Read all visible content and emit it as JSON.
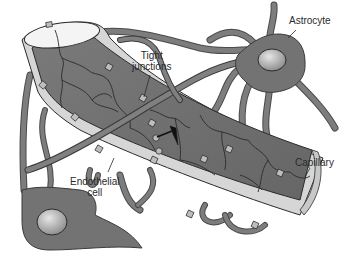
{
  "diagram": {
    "colors": {
      "process": "#7a7a7a",
      "process_stroke": "#3a3a3a",
      "astrocyte_body": "#727272",
      "nucleus": "#b5b5b5",
      "capillary_lumen": "#6f6f6f",
      "capillary_wall": "#d4d4d4",
      "cell_border": "#2b2b2b",
      "background": "#ffffff"
    },
    "labels": {
      "astrocyte": "Astrocyte",
      "tight_junctions_line1": "Tight",
      "tight_junctions_line2": "junctions",
      "capillary": "Capillary",
      "endothelial_line1": "Endothelial",
      "endothelial_line2": "cell"
    }
  }
}
